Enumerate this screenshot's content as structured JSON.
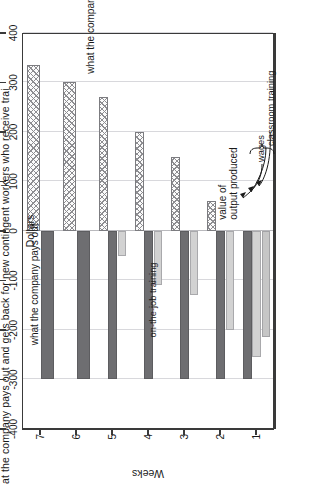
{
  "figure": {
    "main_title": "at the company pays out and gets back for new contingent workers who receive trai",
    "value_axis_title": "Dollars",
    "category_axis_title": "Weeks"
  },
  "value_axis": {
    "labels": [
      "400",
      "300",
      "200",
      "100",
      "0",
      "-100",
      "-200",
      "-300",
      "-400"
    ],
    "values": [
      400,
      300,
      200,
      100,
      0,
      -100,
      -200,
      -300,
      -400
    ]
  },
  "category_axis": {
    "labels": [
      "1",
      "2",
      "3",
      "4",
      "5",
      "6",
      "7"
    ]
  },
  "annotations": {
    "gets_back": "what the company gets back",
    "pays_out": "what the company pays out",
    "value_of_output_line1": "value of",
    "value_of_output_line2": "output produced",
    "wages": "wages",
    "classroom_training": "classroom training",
    "on_the_job_training": "on-the-job training"
  },
  "chart_data": {
    "type": "bar",
    "title": "at the company pays out and gets back for new contingent workers who receive trai",
    "xlabel": "Weeks",
    "ylabel": "Dollars",
    "ylim": [
      -400,
      400
    ],
    "grid": true,
    "orientation": "horizontal-rotated",
    "legend_position": "annotated-inline",
    "categories": [
      "1",
      "2",
      "3",
      "4",
      "5",
      "6",
      "7"
    ],
    "series": [
      {
        "name": "value of output produced",
        "pattern": "crosshatch",
        "color": "#fbfbfb",
        "values": [
          0,
          60,
          150,
          200,
          270,
          300,
          335
        ]
      },
      {
        "name": "wages",
        "pattern": "solid",
        "color": "#6e6e71",
        "values": [
          -300,
          -300,
          -300,
          -300,
          -300,
          -300,
          -300
        ]
      },
      {
        "name": "classroom training",
        "pattern": "solid-light",
        "color": "#d2d2d2",
        "values": [
          -255,
          -200,
          -130,
          -110,
          -50,
          0,
          0
        ]
      },
      {
        "name": "on-the-job training",
        "pattern": "solid-light-2",
        "color": "#c6c6c6",
        "values": [
          -215,
          0,
          0,
          0,
          0,
          0,
          0
        ]
      }
    ]
  }
}
